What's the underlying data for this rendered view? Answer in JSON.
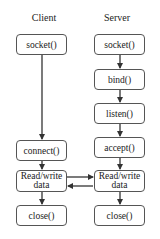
{
  "diagram": {
    "type": "socket-flow",
    "columns": {
      "client": {
        "title": "Client",
        "steps": [
          "socket()",
          "connect()",
          "Read/write data",
          "close()"
        ]
      },
      "server": {
        "title": "Server",
        "steps": [
          "socket()",
          "bind()",
          "listen()",
          "accept()",
          "Read/write data",
          "close()"
        ]
      }
    },
    "labels": {
      "client_title": "Client",
      "server_title": "Server",
      "client_socket": "socket()",
      "client_connect": "connect()",
      "client_rw_line1": "Read/write",
      "client_rw_line2": "data",
      "client_close": "close()",
      "server_socket": "socket()",
      "server_bind": "bind()",
      "server_listen": "listen()",
      "server_accept": "accept()",
      "server_rw_line1": "Read/write",
      "server_rw_line2": "data",
      "server_close": "close()"
    },
    "edges": [
      {
        "from": "client_socket",
        "to": "client_connect"
      },
      {
        "from": "client_connect",
        "to": "client_rw"
      },
      {
        "from": "client_rw",
        "to": "client_close"
      },
      {
        "from": "server_socket",
        "to": "server_bind"
      },
      {
        "from": "server_bind",
        "to": "server_listen"
      },
      {
        "from": "server_listen",
        "to": "server_accept"
      },
      {
        "from": "server_accept",
        "to": "server_rw"
      },
      {
        "from": "server_rw",
        "to": "server_close"
      },
      {
        "from": "client_rw",
        "to": "server_rw"
      },
      {
        "from": "server_rw",
        "to": "client_rw"
      }
    ]
  }
}
